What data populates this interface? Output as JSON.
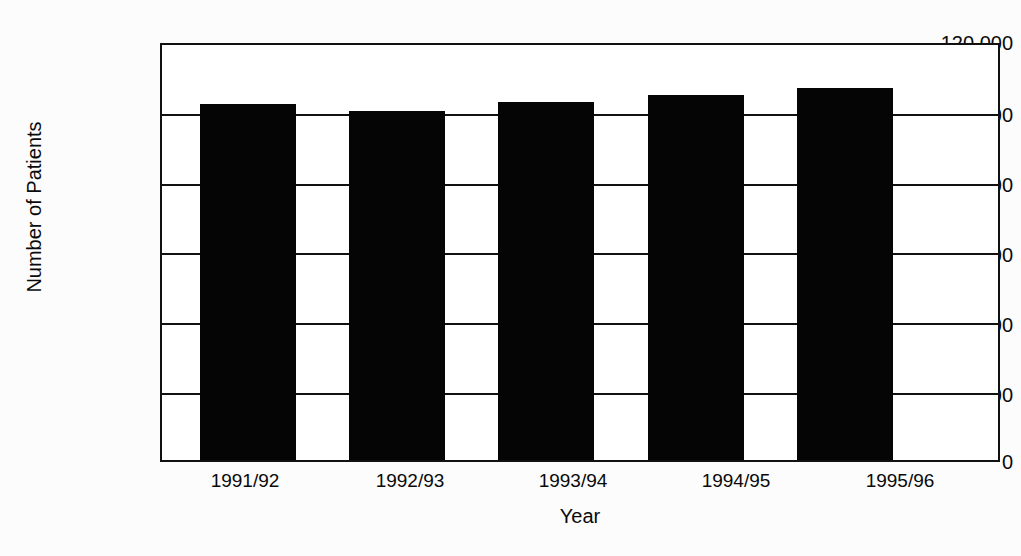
{
  "figure": {
    "background_color": "#fcfcfc",
    "ink_color": "#050505",
    "cropped_title_remnant": ""
  },
  "chart_data": {
    "type": "bar",
    "title": "",
    "xlabel": "Year",
    "ylabel": "Number of Patients",
    "categories": [
      "1991/92",
      "1992/93",
      "1993/94",
      "1994/95",
      "1995/96"
    ],
    "values": [
      103000,
      101000,
      103500,
      105500,
      107500
    ],
    "ylim": [
      0,
      120000
    ],
    "ytick_values": [
      0,
      20000,
      40000,
      60000,
      80000,
      100000,
      120000
    ],
    "ytick_labels": [
      "0",
      "20 000",
      "40 000",
      "60 000",
      "80 000",
      "100 000",
      "120 000"
    ],
    "grid": "horizontal",
    "legend": "none",
    "bar_color": "#050505",
    "series": [
      {
        "name": "Number of Patients",
        "values": [
          103000,
          101000,
          103500,
          105500,
          107500
        ]
      }
    ]
  }
}
